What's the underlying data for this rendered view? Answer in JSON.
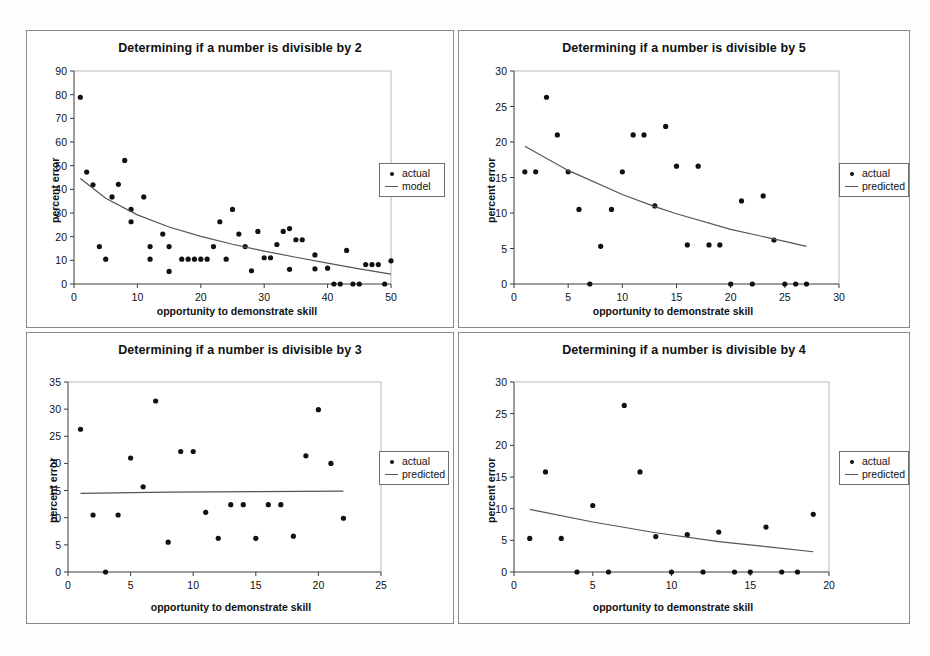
{
  "figure": {
    "background": "#fdfdfd",
    "panel_border": "#8a8a8a",
    "marker_color": "#111111",
    "line_color": "#555555",
    "caption": ""
  },
  "chart_data": [
    {
      "id": "div2",
      "type": "scatter",
      "title": "Determining if a number is divisible by 2",
      "xlabel": "opportunity to demonstrate skill",
      "ylabel": "percent error",
      "xlim": [
        0,
        50
      ],
      "ylim": [
        0,
        90
      ],
      "xticks": [
        0,
        10,
        20,
        30,
        40,
        50
      ],
      "yticks": [
        0,
        10,
        20,
        30,
        40,
        50,
        60,
        70,
        80,
        90
      ],
      "grid": false,
      "legend_position": "right",
      "legend": [
        {
          "label": "actual",
          "mark": "dot"
        },
        {
          "label": "model",
          "mark": "line"
        }
      ],
      "series": [
        {
          "name": "actual",
          "mark": "dot",
          "points": [
            [
              1,
              78.9
            ],
            [
              2,
              47.3
            ],
            [
              3,
              41.9
            ],
            [
              4,
              15.8
            ],
            [
              5,
              10.5
            ],
            [
              6,
              36.8
            ],
            [
              7,
              42.1
            ],
            [
              8,
              52.2
            ],
            [
              9,
              31.5
            ],
            [
              9,
              26.3
            ],
            [
              11,
              36.8
            ],
            [
              12,
              15.8
            ],
            [
              12,
              10.5
            ],
            [
              14,
              21.1
            ],
            [
              15,
              5.3
            ],
            [
              15,
              15.8
            ],
            [
              17,
              10.5
            ],
            [
              18,
              10.5
            ],
            [
              19,
              10.5
            ],
            [
              20,
              10.5
            ],
            [
              21,
              10.5
            ],
            [
              22,
              15.8
            ],
            [
              23,
              26.3
            ],
            [
              24,
              10.5
            ],
            [
              25,
              31.5
            ],
            [
              26,
              21.1
            ],
            [
              27,
              15.8
            ],
            [
              28,
              5.6
            ],
            [
              29,
              22.2
            ],
            [
              30,
              11.1
            ],
            [
              31,
              11.1
            ],
            [
              32,
              16.7
            ],
            [
              33,
              22.2
            ],
            [
              34,
              23.4
            ],
            [
              34,
              6.2
            ],
            [
              35,
              18.7
            ],
            [
              36,
              18.7
            ],
            [
              38,
              12.3
            ],
            [
              38,
              6.4
            ],
            [
              40,
              6.7
            ],
            [
              41,
              0
            ],
            [
              42,
              0
            ],
            [
              43,
              14.2
            ],
            [
              44,
              0
            ],
            [
              45,
              0
            ],
            [
              46,
              8.2
            ],
            [
              47,
              8.2
            ],
            [
              48,
              8.2
            ],
            [
              49,
              0
            ],
            [
              50,
              9.8
            ]
          ]
        },
        {
          "name": "model",
          "mark": "line",
          "points": [
            [
              1,
              44.6
            ],
            [
              5,
              36.2
            ],
            [
              10,
              29.2
            ],
            [
              15,
              24.1
            ],
            [
              20,
              20.1
            ],
            [
              25,
              16.8
            ],
            [
              30,
              13.9
            ],
            [
              35,
              11.3
            ],
            [
              40,
              8.8
            ],
            [
              45,
              6.4
            ],
            [
              50,
              4.2
            ]
          ]
        }
      ]
    },
    {
      "id": "div5",
      "type": "scatter",
      "title": "Determining if a number is divisible by 5",
      "xlabel": "opportunity to demonstrate skill",
      "ylabel": "percent error",
      "xlim": [
        0,
        30
      ],
      "ylim": [
        0,
        30
      ],
      "xticks": [
        0,
        5,
        10,
        15,
        20,
        25,
        30
      ],
      "yticks": [
        0,
        5,
        10,
        15,
        20,
        25,
        30
      ],
      "grid": false,
      "legend_position": "right",
      "legend": [
        {
          "label": "actual",
          "mark": "dot"
        },
        {
          "label": "predicted",
          "mark": "line"
        }
      ],
      "series": [
        {
          "name": "actual",
          "mark": "dot",
          "points": [
            [
              1,
              15.8
            ],
            [
              2,
              15.8
            ],
            [
              3,
              26.3
            ],
            [
              4,
              21.0
            ],
            [
              5,
              15.8
            ],
            [
              6,
              10.5
            ],
            [
              7,
              0
            ],
            [
              8,
              5.3
            ],
            [
              9,
              10.5
            ],
            [
              10,
              15.8
            ],
            [
              11,
              21.0
            ],
            [
              12,
              21.0
            ],
            [
              13,
              11.0
            ],
            [
              14,
              22.2
            ],
            [
              15,
              16.6
            ],
            [
              16,
              5.5
            ],
            [
              17,
              16.6
            ],
            [
              18,
              5.5
            ],
            [
              19,
              5.5
            ],
            [
              20,
              0
            ],
            [
              21,
              11.7
            ],
            [
              22,
              0
            ],
            [
              23,
              12.4
            ],
            [
              24,
              6.2
            ],
            [
              25,
              0
            ],
            [
              26,
              0
            ],
            [
              27,
              0
            ]
          ]
        },
        {
          "name": "predicted",
          "mark": "line",
          "points": [
            [
              1,
              19.4
            ],
            [
              5,
              16.0
            ],
            [
              10,
              12.6
            ],
            [
              13,
              10.9
            ],
            [
              15,
              9.9
            ],
            [
              20,
              7.7
            ],
            [
              25,
              6.0
            ],
            [
              27,
              5.3
            ]
          ]
        }
      ]
    },
    {
      "id": "div3",
      "type": "scatter",
      "title": "Determining if a number is divisible by 3",
      "xlabel": "opportunity to demonstrate skill",
      "ylabel": "percent error",
      "xlim": [
        0,
        25
      ],
      "ylim": [
        0,
        35
      ],
      "xticks": [
        0,
        5,
        10,
        15,
        20,
        25
      ],
      "yticks": [
        0,
        5,
        10,
        15,
        20,
        25,
        30,
        35
      ],
      "grid": false,
      "legend_position": "right",
      "legend": [
        {
          "label": "actual",
          "mark": "dot"
        },
        {
          "label": "predicted",
          "mark": "line"
        }
      ],
      "series": [
        {
          "name": "actual",
          "mark": "dot",
          "points": [
            [
              1,
              26.3
            ],
            [
              2,
              10.5
            ],
            [
              3,
              0
            ],
            [
              4,
              10.5
            ],
            [
              5,
              21.0
            ],
            [
              6,
              15.7
            ],
            [
              7,
              31.5
            ],
            [
              8,
              5.5
            ],
            [
              9,
              22.2
            ],
            [
              10,
              22.2
            ],
            [
              11,
              11.0
            ],
            [
              12,
              6.2
            ],
            [
              13,
              12.4
            ],
            [
              14,
              12.4
            ],
            [
              15,
              6.2
            ],
            [
              16,
              12.4
            ],
            [
              17,
              12.4
            ],
            [
              18,
              6.6
            ],
            [
              19,
              21.4
            ],
            [
              20,
              29.9
            ],
            [
              21,
              20.0
            ],
            [
              22,
              9.9
            ]
          ]
        },
        {
          "name": "predicted",
          "mark": "line",
          "points": [
            [
              1,
              14.5
            ],
            [
              8,
              14.7
            ],
            [
              15,
              14.8
            ],
            [
              22,
              14.9
            ]
          ]
        }
      ]
    },
    {
      "id": "div4",
      "type": "scatter",
      "title": "Determining if a number is divisible by 4",
      "xlabel": "opportunity to demonstrate skill",
      "ylabel": "percent error",
      "xlim": [
        0,
        20
      ],
      "ylim": [
        0,
        30
      ],
      "xticks": [
        0,
        5,
        10,
        15,
        20
      ],
      "yticks": [
        0,
        5,
        10,
        15,
        20,
        25,
        30
      ],
      "grid": false,
      "legend_position": "right",
      "legend": [
        {
          "label": "actual",
          "mark": "dot"
        },
        {
          "label": "predicted",
          "mark": "line"
        }
      ],
      "series": [
        {
          "name": "actual",
          "mark": "dot",
          "points": [
            [
              1,
              5.3
            ],
            [
              2,
              15.8
            ],
            [
              3,
              5.3
            ],
            [
              4,
              0
            ],
            [
              5,
              10.5
            ],
            [
              6,
              0
            ],
            [
              7,
              26.3
            ],
            [
              8,
              15.8
            ],
            [
              9,
              5.6
            ],
            [
              10,
              0
            ],
            [
              11,
              5.9
            ],
            [
              12,
              0
            ],
            [
              13,
              6.3
            ],
            [
              14,
              0
            ],
            [
              15,
              0
            ],
            [
              16,
              7.1
            ],
            [
              17,
              0
            ],
            [
              18,
              0
            ],
            [
              19,
              9.1
            ]
          ]
        },
        {
          "name": "predicted",
          "mark": "line",
          "points": [
            [
              1,
              9.9
            ],
            [
              5,
              7.9
            ],
            [
              9,
              6.2
            ],
            [
              13,
              4.8
            ],
            [
              16,
              4.0
            ],
            [
              19,
              3.2
            ]
          ]
        }
      ]
    }
  ],
  "panels": [
    {
      "id": "div2",
      "x": 26,
      "y": 30,
      "w": 428,
      "h": 298
    },
    {
      "id": "div5",
      "x": 458,
      "y": 30,
      "w": 452,
      "h": 298
    },
    {
      "id": "div3",
      "x": 26,
      "y": 332,
      "w": 428,
      "h": 292
    },
    {
      "id": "div4",
      "x": 458,
      "y": 332,
      "w": 452,
      "h": 292
    }
  ]
}
